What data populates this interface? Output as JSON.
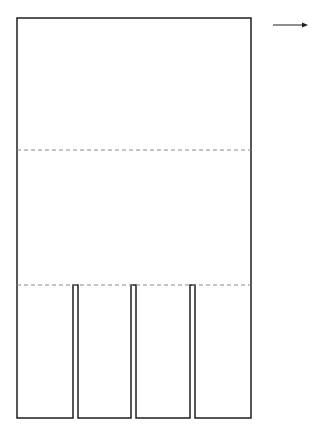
{
  "diagram": {
    "type": "folding-template",
    "colors": {
      "stroke": "#1f1f1f",
      "fold": "#8a8a8a",
      "arrow": "#1f1f1f",
      "background": "#ffffff"
    },
    "outline": {
      "x": 17,
      "y": 18,
      "width": 234,
      "height": 400
    },
    "fold_lines": [
      {
        "y": 150,
        "style": "dashed"
      },
      {
        "y": 285,
        "style": "dashed"
      }
    ],
    "slits": [
      {
        "x": 73,
        "width": 5,
        "top": 285,
        "bottom": 418
      },
      {
        "x": 131,
        "width": 5,
        "top": 285,
        "bottom": 418
      },
      {
        "x": 190,
        "width": 5,
        "top": 285,
        "bottom": 418
      }
    ],
    "arrow": {
      "x1": 273,
      "x2": 308,
      "y": 25,
      "direction": "right"
    }
  }
}
